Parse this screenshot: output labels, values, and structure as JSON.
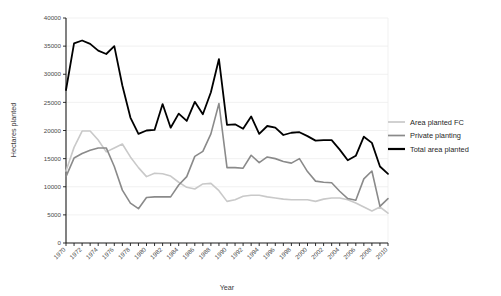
{
  "chart_data": {
    "type": "line",
    "title": "",
    "xlabel": "Year",
    "ylabel": "Hectares planted",
    "xlim": [
      1970,
      2010
    ],
    "ylim": [
      0,
      40000
    ],
    "grid": true,
    "legend_position": "right",
    "x": [
      1970,
      1971,
      1972,
      1973,
      1974,
      1975,
      1976,
      1977,
      1978,
      1979,
      1980,
      1981,
      1982,
      1983,
      1984,
      1985,
      1986,
      1987,
      1988,
      1989,
      1990,
      1991,
      1992,
      1993,
      1994,
      1995,
      1996,
      1997,
      1998,
      1999,
      2000,
      2001,
      2002,
      2003,
      2004,
      2005,
      2006,
      2007,
      2008,
      2009,
      2010
    ],
    "xticks": [
      1970,
      1972,
      1974,
      1976,
      1978,
      1980,
      1982,
      1984,
      1986,
      1988,
      1990,
      1992,
      1994,
      1996,
      1998,
      2000,
      2002,
      2004,
      2006,
      2008,
      2010
    ],
    "xtick_labels": [
      "1970",
      "1972",
      "1974",
      "1976",
      "1978",
      "1980",
      "1982",
      "1984",
      "1986",
      "1988",
      "1990",
      "1992",
      "1994",
      "1996",
      "1998",
      "2000",
      "2002",
      "2004",
      "2006",
      "2008",
      "2010"
    ],
    "yticks": [
      0,
      5000,
      10000,
      15000,
      20000,
      25000,
      30000,
      35000,
      40000
    ],
    "ytick_labels": [
      "0",
      "5000",
      "10000",
      "15000",
      "20000",
      "25000",
      "30000",
      "35000",
      "40000"
    ],
    "series": [
      {
        "name": "Area planted FC",
        "color": "#c9c9c9",
        "width": 1.6,
        "values": [
          12800,
          17000,
          19900,
          19900,
          18300,
          16200,
          16900,
          17600,
          15300,
          13400,
          11800,
          12400,
          12300,
          11900,
          10800,
          9900,
          9600,
          10500,
          10600,
          9300,
          7400,
          7700,
          8300,
          8500,
          8500,
          8200,
          8000,
          7800,
          7700,
          7700,
          7700,
          7400,
          7800,
          8000,
          8000,
          7700,
          7100,
          6400,
          5700,
          6400,
          5300
        ]
      },
      {
        "name": "Private planting",
        "color": "#8a8a8a",
        "width": 1.6,
        "values": [
          11800,
          15100,
          15900,
          16500,
          16900,
          16900,
          13600,
          9400,
          7100,
          6100,
          8100,
          8200,
          8200,
          8200,
          10300,
          11800,
          15400,
          16300,
          19400,
          24800,
          13400,
          13400,
          13300,
          15600,
          14300,
          15300,
          15000,
          14500,
          14200,
          15000,
          12700,
          11000,
          10800,
          10700,
          9200,
          7900,
          7600,
          11400,
          12800,
          6500,
          7900
        ]
      },
      {
        "name": "Total area planted",
        "color": "#000000",
        "width": 1.8,
        "values": [
          27200,
          35500,
          36000,
          35400,
          34200,
          33600,
          35000,
          28000,
          22300,
          19400,
          20000,
          20100,
          24700,
          20500,
          23000,
          21700,
          25100,
          22900,
          26800,
          32700,
          21000,
          21100,
          20300,
          22500,
          19400,
          20800,
          20500,
          19200,
          19600,
          19700,
          19000,
          18200,
          18300,
          18300,
          16600,
          14700,
          15500,
          18900,
          17800,
          13600,
          12300
        ]
      }
    ],
    "legend_entries": [
      {
        "label": "Area planted FC",
        "color": "#c9c9c9"
      },
      {
        "label": "Private planting",
        "color": "#8a8a8a"
      },
      {
        "label": "Total area planted",
        "color": "#000000"
      }
    ]
  }
}
